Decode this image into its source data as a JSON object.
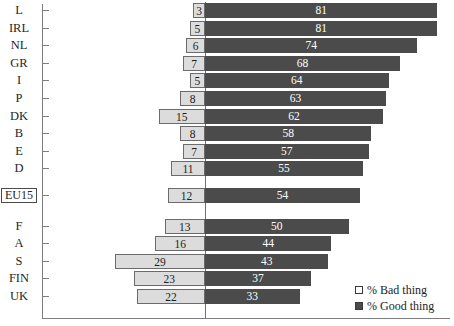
{
  "chart_data": {
    "type": "bar",
    "orientation": "horizontal",
    "style": "diverging-stacked",
    "title": "",
    "xlabel": "",
    "ylabel": "",
    "grid": false,
    "zero_line": true,
    "categories": [
      "L",
      "IRL",
      "NL",
      "GR",
      "I",
      "P",
      "DK",
      "B",
      "E",
      "D",
      "EU15",
      "F",
      "A",
      "S",
      "FIN",
      "UK"
    ],
    "series": [
      {
        "name": "% Bad thing",
        "color": "#dcdcdc",
        "direction": "left",
        "values": [
          3,
          5,
          6,
          7,
          5,
          8,
          15,
          8,
          7,
          11,
          12,
          13,
          16,
          29,
          23,
          22
        ]
      },
      {
        "name": "% Good thing",
        "color": "#4b4b4b",
        "direction": "right",
        "values": [
          81,
          81,
          74,
          68,
          64,
          63,
          62,
          58,
          57,
          55,
          54,
          50,
          44,
          43,
          37,
          33
        ]
      }
    ],
    "legend": {
      "position": "bottom-right",
      "entries": [
        {
          "label": "% Bad thing",
          "swatch": "light"
        },
        {
          "label": "% Good thing",
          "swatch": "dark"
        }
      ]
    },
    "highlighted_category": "EU15",
    "xlim": [
      -35,
      90
    ],
    "axis_color": "#7d7d86"
  },
  "legend": {
    "bad_label": "% Bad thing",
    "good_label": "% Good thing"
  }
}
